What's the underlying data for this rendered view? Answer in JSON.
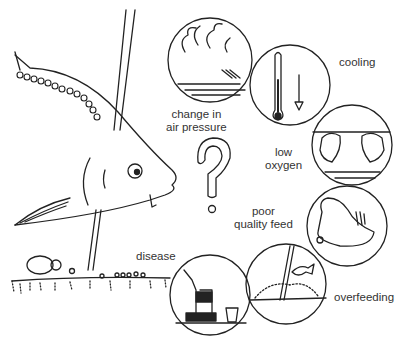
{
  "labels": {
    "air_pressure": [
      "change in",
      "air pressure"
    ],
    "cooling": "cooling",
    "low_oxygen": [
      "low",
      "oxygen"
    ],
    "poor_feed": [
      "poor",
      "quality feed"
    ],
    "overfeeding": "overfeeding",
    "disease": "disease"
  },
  "colors": {
    "ink": "#222222",
    "background": "#ffffff"
  }
}
